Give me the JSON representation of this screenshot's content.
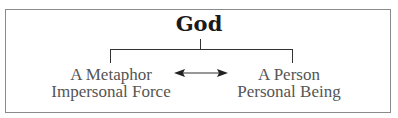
{
  "diagram": {
    "title": "God",
    "left": {
      "line1": "A Metaphor",
      "line2": "Impersonal Force"
    },
    "right": {
      "line1": "A Person",
      "line2": "Personal Being"
    },
    "connector": "double-arrow"
  },
  "colors": {
    "border": "#8a8a8a",
    "lines": "#333333",
    "title": "#1a1a1a",
    "label": "#555555"
  }
}
